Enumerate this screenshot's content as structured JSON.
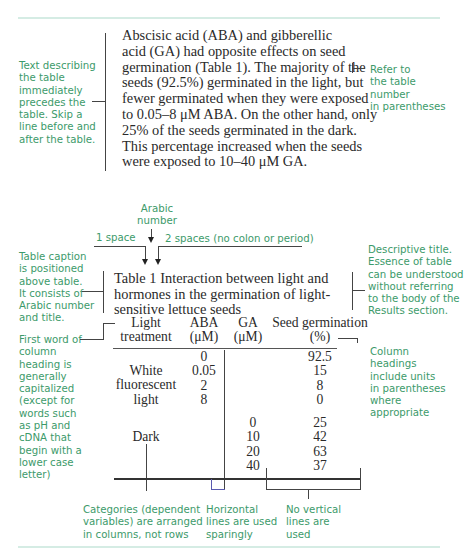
{
  "paragraph": {
    "lines": [
      "Abscisic acid (ABA) and gibberellic",
      "acid (GA) had opposite effects on seed",
      "germination (Table 1). The majority of the",
      "seeds (92.5%) germinated in the light, but",
      "fewer germinated when they were exposed",
      "to 0.05–8 μM ABA. On the other hand, only",
      "25% of the seeds germinated in the dark.",
      "This percentage increased when the seeds",
      "were exposed to 10–40 μM GA."
    ]
  },
  "annotations": {
    "text_precedes": [
      "Text describing",
      "the table",
      "immediately",
      "precedes the",
      "table. Skip a",
      "line before and",
      "after the table."
    ],
    "refer_table": [
      "Refer to",
      "the table",
      "number",
      "in parentheses"
    ],
    "arabic_number": [
      "Arabic",
      "number"
    ],
    "one_space": "1 space",
    "two_spaces": "2 spaces (no colon or period)",
    "caption_position": [
      "Table caption",
      "is positioned",
      "above table.",
      "It consists of",
      "Arabic number",
      "and title."
    ],
    "descriptive_title": [
      "Descriptive title.",
      "Essence of table",
      "can be understood",
      "without referring",
      "to the body of the",
      "Results section."
    ],
    "first_word": [
      "First word of",
      "column",
      "heading is",
      "generally",
      "capitalized",
      "(except for",
      "words such",
      "as pH and",
      "cDNA that",
      "begin with a",
      "lower case",
      "letter)"
    ],
    "column_headings": [
      "Column",
      "headings",
      "include units",
      "in parentheses",
      "where",
      "appropriate"
    ],
    "categories": [
      "Categories (dependent",
      "variables) are arranged",
      "in columns, not rows"
    ],
    "horizontal_lines": [
      "Horizontal",
      "lines are used",
      "sparingly"
    ],
    "no_vertical": [
      "No vertical",
      "lines are",
      "used"
    ]
  },
  "table": {
    "caption_lines": [
      "Table 1  Interaction between light and",
      "hormones in the germination of light-",
      "sensitive lettuce seeds"
    ],
    "headers": {
      "light": [
        "Light",
        "treatment"
      ],
      "aba": [
        "ABA",
        "(μM)"
      ],
      "ga": [
        "GA",
        "(μM)"
      ],
      "germ": [
        "Seed germination",
        "(%)"
      ]
    },
    "light_label": [
      "White",
      "fluorescent",
      "light"
    ],
    "dark_label": "Dark",
    "light_rows": [
      {
        "aba": "0",
        "germ": "92.5"
      },
      {
        "aba": "0.05",
        "germ": "15"
      },
      {
        "aba": "2",
        "germ": "8"
      },
      {
        "aba": "8",
        "germ": "0"
      }
    ],
    "dark_rows": [
      {
        "ga": "0",
        "germ": "25"
      },
      {
        "ga": "10",
        "germ": "42"
      },
      {
        "ga": "20",
        "germ": "63"
      },
      {
        "ga": "40",
        "germ": "37"
      }
    ]
  },
  "colors": {
    "annotation": "#3c9a6a",
    "rule": "#d5ece4",
    "text": "#2a2a2a"
  }
}
